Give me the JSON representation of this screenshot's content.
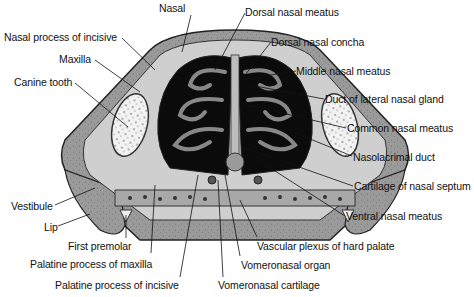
{
  "figure": {
    "labels": [
      {
        "id": "nasal",
        "text": "Nasal",
        "x": 159,
        "y": 8
      },
      {
        "id": "nasal-process-of-incisive",
        "text": "Nasal process of incisive",
        "x": 4,
        "y": 31
      },
      {
        "id": "maxilla",
        "text": "Maxilla",
        "x": 59,
        "y": 55
      },
      {
        "id": "canine-tooth",
        "text": "Canine tooth",
        "x": 14,
        "y": 76
      },
      {
        "id": "dorsal-nasal-meatus",
        "text": "Dorsal nasal meatus",
        "x": 245,
        "y": 6
      },
      {
        "id": "dorsal-nasal-concha",
        "text": "Dorsal nasal concha",
        "x": 271,
        "y": 36
      },
      {
        "id": "middle-nasal-meatus",
        "text": "Middle nasal meatus",
        "x": 296,
        "y": 65
      },
      {
        "id": "duct-of-lateral-nasal-gland",
        "text": "Duct of lateral nasal gland",
        "x": 325,
        "y": 93
      },
      {
        "id": "common-nasal-meatus",
        "text": "Common nasal meatus",
        "x": 347,
        "y": 122
      },
      {
        "id": "nasolacrimal-duct",
        "text": "Nasolacrimal duct",
        "x": 353,
        "y": 150
      },
      {
        "id": "cartilage-of-nasal-septum",
        "text": "Cartilage of nasal septum",
        "x": 354,
        "y": 180
      },
      {
        "id": "ventral-nasal-meatus",
        "text": "Ventral nasal meatus",
        "x": 346,
        "y": 210
      },
      {
        "id": "vestibule",
        "text": "Vestibule",
        "x": 11,
        "y": 200
      },
      {
        "id": "lip",
        "text": "Lip",
        "x": 44,
        "y": 222
      },
      {
        "id": "first-premolar",
        "text": "First premolar",
        "x": 68,
        "y": 240
      },
      {
        "id": "palatine-process-of-maxilla",
        "text": "Palatine process of maxilla",
        "x": 30,
        "y": 256
      },
      {
        "id": "palatine-process-of-incisive",
        "text": "Palatine process of incisive",
        "x": 55,
        "y": 280
      },
      {
        "id": "vascular-plexus-of-hard-palate",
        "text": "Vascular plexus of hard palate",
        "x": 257,
        "y": 240
      },
      {
        "id": "vomeronasal-organ",
        "text": "Vomeronasal organ",
        "x": 241,
        "y": 258
      },
      {
        "id": "vomeronasal-cartilage",
        "text": "Vomeronasal cartilage",
        "x": 218,
        "y": 279
      }
    ]
  }
}
